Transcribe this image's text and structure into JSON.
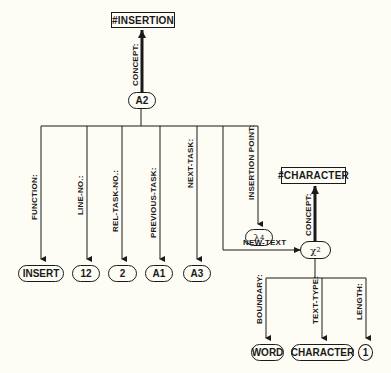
{
  "diagram": {
    "top_concept": "#INSERTION",
    "root_node": "A2",
    "root_concept_label": "CONCEPT:",
    "slots": [
      {
        "label": "FUNCTION:",
        "value": "INSERT"
      },
      {
        "label": "LINE-NO.:",
        "value": "12"
      },
      {
        "label": "REL-TASK-NO.:",
        "value": "2"
      },
      {
        "label": "PREVIOUS-TASK:",
        "value": "A1"
      },
      {
        "label": "NEXT-TASK:",
        "value": "A3"
      },
      {
        "label": "INSERTION POINT:",
        "value": "λ",
        "subscript": "4"
      }
    ],
    "new_text_label": "NEW-TEXT",
    "sub_node": {
      "symbol": "χ",
      "subscript": "2"
    },
    "sub_concept": "#CHARACTER",
    "sub_concept_label": "CONCEPT:",
    "sub_slots": [
      {
        "label": "BOUNDARY:",
        "value": "WORD"
      },
      {
        "label": "TEXT-TYPE:",
        "value": "CHARACTER"
      },
      {
        "label": "LENGTH:",
        "value": "1"
      }
    ]
  }
}
